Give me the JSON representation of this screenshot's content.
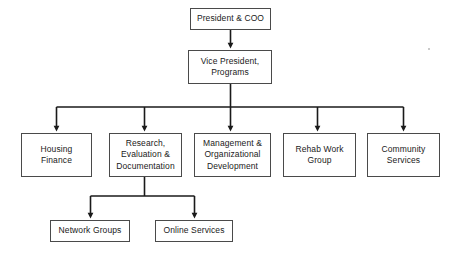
{
  "chart": {
    "type": "org-chart",
    "canvas": {
      "width": 458,
      "height": 258,
      "background": "#ffffff"
    },
    "style": {
      "box_border_color": "#4a4a4a",
      "box_fill_color": "#ffffff",
      "connector_color": "#1a1a1a",
      "text_color": "#1a1a1a"
    },
    "nodes": [
      {
        "id": "president-coo",
        "label": "President & COO",
        "level": 1,
        "x": 190,
        "y": 8,
        "width": 81,
        "height": 22
      },
      {
        "id": "vice-president-programs",
        "label": "Vice President,\nPrograms",
        "level": 2,
        "x": 188,
        "y": 50,
        "width": 84,
        "height": 34
      },
      {
        "id": "housing-finance",
        "label": "Housing\nFinance",
        "level": 3,
        "x": 21,
        "y": 133,
        "width": 71,
        "height": 44
      },
      {
        "id": "research-evaluation-documentation",
        "label": "Research,\nEvaluation &\nDocumentation",
        "level": 3,
        "x": 109,
        "y": 133,
        "width": 73,
        "height": 44
      },
      {
        "id": "management-organizational-development",
        "label": "Management &\nOrganizational\nDevelopment",
        "level": 3,
        "x": 194,
        "y": 133,
        "width": 77,
        "height": 44
      },
      {
        "id": "rehab-work-group",
        "label": "Rehab Work\nGroup",
        "level": 3,
        "x": 283,
        "y": 133,
        "width": 73,
        "height": 44
      },
      {
        "id": "community-services",
        "label": "Community\nServices",
        "level": 3,
        "x": 367,
        "y": 133,
        "width": 73,
        "height": 44
      },
      {
        "id": "network-groups",
        "label": "Network Groups",
        "level": 4,
        "x": 50,
        "y": 220,
        "width": 80,
        "height": 22
      },
      {
        "id": "online-services",
        "label": "Online Services",
        "level": 4,
        "x": 155,
        "y": 220,
        "width": 78,
        "height": 22
      }
    ],
    "edges": [
      {
        "from": "president-coo",
        "to": "vice-president-programs",
        "style": "vertical-arrow"
      },
      {
        "from": "vice-president-programs",
        "to": "housing-finance",
        "style": "bus-arrow"
      },
      {
        "from": "vice-president-programs",
        "to": "research-evaluation-documentation",
        "style": "bus-arrow"
      },
      {
        "from": "vice-president-programs",
        "to": "management-organizational-development",
        "style": "bus-arrow"
      },
      {
        "from": "vice-president-programs",
        "to": "rehab-work-group",
        "style": "bus-arrow"
      },
      {
        "from": "vice-president-programs",
        "to": "community-services",
        "style": "bus-arrow"
      },
      {
        "from": "research-evaluation-documentation",
        "to": "network-groups",
        "style": "bus-arrow"
      },
      {
        "from": "research-evaluation-documentation",
        "to": "online-services",
        "style": "bus-arrow"
      }
    ],
    "artifacts": [
      {
        "id": "speck",
        "x": 428,
        "y": 48
      }
    ]
  }
}
